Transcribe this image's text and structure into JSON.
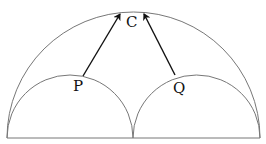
{
  "diagram": {
    "labels": {
      "top": "C",
      "left": "P",
      "right": "Q"
    },
    "colors": {
      "arc": "#777777",
      "arrow": "#111111",
      "background": "#ffffff"
    }
  }
}
